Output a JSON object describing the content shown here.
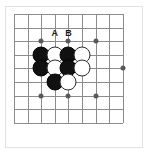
{
  "diagram": {
    "kind": "go-board-problem",
    "title": "",
    "board": {
      "columns": 9,
      "rows": 9,
      "origin_x": 14,
      "origin_y": 14,
      "spacing": 13.6,
      "line_color": "#8c8c8c",
      "frame_color": "#e2e2e2",
      "background": "#ffffff"
    },
    "star_points": [
      {
        "col": 2,
        "row": 2
      },
      {
        "col": 4,
        "row": 2
      },
      {
        "col": 6,
        "row": 2
      },
      {
        "col": 8,
        "row": 4
      },
      {
        "col": 2,
        "row": 6
      },
      {
        "col": 4,
        "row": 6
      },
      {
        "col": 6,
        "row": 6
      }
    ],
    "stones": [
      {
        "col": 2,
        "row": 3,
        "color": "black"
      },
      {
        "col": 3,
        "row": 3,
        "color": "white"
      },
      {
        "col": 4,
        "row": 3,
        "color": "black"
      },
      {
        "col": 5,
        "row": 3,
        "color": "white"
      },
      {
        "col": 2,
        "row": 4,
        "color": "black"
      },
      {
        "col": 3,
        "row": 4,
        "color": "white"
      },
      {
        "col": 4,
        "row": 4,
        "color": "black"
      },
      {
        "col": 5,
        "row": 4,
        "color": "white"
      },
      {
        "col": 3,
        "row": 5,
        "color": "black"
      },
      {
        "col": 4,
        "row": 5,
        "color": "white"
      }
    ],
    "labels": [
      {
        "text": "A",
        "col": 3,
        "row": 2,
        "offset_y": -1
      },
      {
        "text": "B",
        "col": 4,
        "row": 2,
        "offset_y": -1
      }
    ],
    "stone_colors": {
      "black_fill": "#111111",
      "black_stroke": "#050505",
      "white_fill": "#ffffff",
      "white_stroke": "#2b2b2b",
      "star_fill": "#58595b"
    }
  }
}
